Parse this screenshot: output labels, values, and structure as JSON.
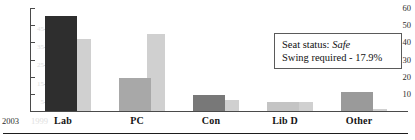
{
  "chart_data": {
    "type": "bar",
    "title": "",
    "subtitle": "",
    "xlabel": "",
    "ylabel": "",
    "grid": false,
    "legend_position": "axis-labels-bottom-left",
    "categories": [
      "Lab",
      "PC",
      "Con",
      "Lib D",
      "Other"
    ],
    "series": [
      {
        "name": "2003",
        "color": "#2e2e2e",
        "values": [
          55.5,
          19.5,
          9.3,
          5.5,
          10.8
        ]
      },
      {
        "name": "1999",
        "color": "#d0d0d0",
        "values": [
          39.5,
          42.0,
          6.0,
          5.0,
          1.0
        ]
      }
    ],
    "y_axis_primary": {
      "label": "2003",
      "min": 0,
      "max": 60,
      "ticks": [
        60,
        50,
        40,
        30,
        20,
        10
      ]
    },
    "y_axis_secondary": {
      "label": "1999",
      "min": 0,
      "max": 50,
      "ticks": [
        45,
        35,
        25,
        15,
        5
      ]
    },
    "annotations": [
      {
        "label": "Seat status:",
        "value": "Safe",
        "italic_value": true
      },
      {
        "label": "Swing required - 17.9%",
        "value": "",
        "italic_value": false
      }
    ]
  },
  "annotation_box": {
    "line1_prefix": "Seat status: ",
    "line1_emphasis": "Safe",
    "line2": "Swing required - 17.9%"
  },
  "colors": {
    "bar_2003_lab": "#2e2e2e",
    "bar_2003_pc": "#a8a8a8",
    "bar_2003_con": "#787878",
    "bar_2003_libd": "#c4c4c4",
    "bar_2003_other": "#9a9a9a",
    "bar_1999": "#e2e2e2",
    "axis": "#4a4a4a",
    "axis_secondary": "#dcdcdc",
    "text": "#141414"
  }
}
